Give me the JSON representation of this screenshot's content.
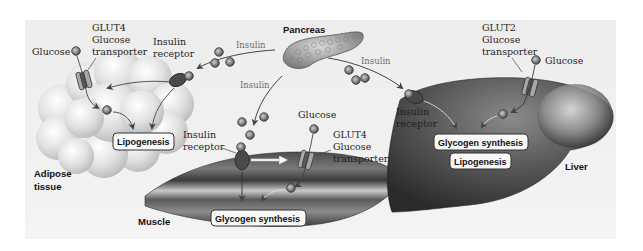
{
  "diagram": {
    "colors": {
      "panel_bg": "#efefef",
      "molecule_fill": "#8a8a8a",
      "receptor_fill": "#4a4a4a",
      "transporter_fill": "#9a9a9a",
      "arrow": "#4a4a4a",
      "tissue_dark": "#3f3f3f",
      "tissue_light": "#d6d6d6"
    },
    "pancreas": {
      "label": "Pancreas",
      "insulin_labels": [
        "Insulin",
        "Insulin",
        "Insulin"
      ]
    },
    "adipose": {
      "tissue_label_line1": "Adipose",
      "tissue_label_line2": "tissue",
      "glucose_label": "Glucose",
      "transporter_line1": "GLUT4",
      "transporter_line2": "Glucose",
      "transporter_line3": "transporter",
      "receptor_line1": "Insulin",
      "receptor_line2": "receptor",
      "process": "Lipogenesis"
    },
    "muscle": {
      "tissue_label": "Muscle",
      "glucose_label": "Glucose",
      "transporter_line1": "GLUT4",
      "transporter_line2": "Glucose",
      "transporter_line3": "transporter",
      "receptor_line1": "Insulin",
      "receptor_line2": "receptor",
      "process": "Glycogen synthesis"
    },
    "liver": {
      "tissue_label": "Liver",
      "glucose_label": "Glucose",
      "transporter_line1": "GLUT2",
      "transporter_line2": "Glucose",
      "transporter_line3": "transporter",
      "receptor_line1": "Insulin",
      "receptor_line2": "receptor",
      "process_1": "Glycogen synthesis",
      "process_2": "Lipogenesis"
    }
  }
}
